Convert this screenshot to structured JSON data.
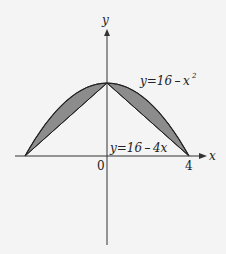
{
  "diagram": {
    "axes": {
      "x_label": "x",
      "y_label": "y"
    },
    "ticks": {
      "origin": "0",
      "x_right": "4"
    },
    "curve_label": {
      "prefix": "y=16 – x",
      "exponent": "2"
    },
    "line_label": "y=16 – 4x",
    "colors": {
      "shade": "#8c8c8c",
      "stroke": "#222222",
      "background": "#f4f4f4"
    }
  }
}
